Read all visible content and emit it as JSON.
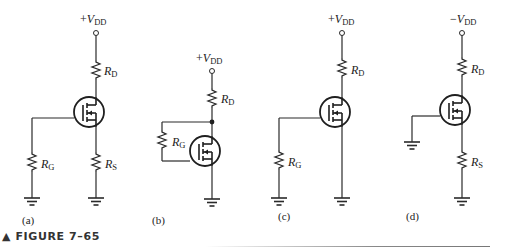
{
  "figure": {
    "caption_marker": "▲",
    "caption": "FIGURE 7–65"
  },
  "circuits": [
    {
      "id": "a",
      "label": "(a)",
      "supply": {
        "sign": "+",
        "name": "V",
        "sub": "DD"
      },
      "resistors": [
        {
          "name": "R",
          "sub": "D"
        },
        {
          "name": "R",
          "sub": "G"
        },
        {
          "name": "R",
          "sub": "S"
        }
      ]
    },
    {
      "id": "b",
      "label": "(b)",
      "supply": {
        "sign": "+",
        "name": "V",
        "sub": "DD"
      },
      "resistors": [
        {
          "name": "R",
          "sub": "D"
        },
        {
          "name": "R",
          "sub": "G"
        }
      ]
    },
    {
      "id": "c",
      "label": "(c)",
      "supply": {
        "sign": "+",
        "name": "V",
        "sub": "DD"
      },
      "resistors": [
        {
          "name": "R",
          "sub": "D"
        },
        {
          "name": "R",
          "sub": "G"
        }
      ]
    },
    {
      "id": "d",
      "label": "(d)",
      "supply": {
        "sign": "−",
        "name": "V",
        "sub": "DD"
      },
      "resistors": [
        {
          "name": "R",
          "sub": "D"
        },
        {
          "name": "R",
          "sub": "S"
        }
      ]
    }
  ],
  "colors": {
    "line": "#2a2a2a",
    "background": "#ffffff"
  }
}
